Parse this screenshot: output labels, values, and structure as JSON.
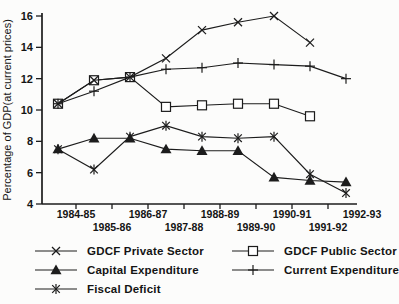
{
  "figure": {
    "background": "#fcfcfb",
    "line_color": "#1c1c1c",
    "text_color": "#141414",
    "marker_fill": "#ffffff"
  },
  "chart_data": {
    "type": "line",
    "title": "",
    "xlabel": "",
    "ylabel": "Percentage of GDP(at current prices)",
    "ylim": [
      4,
      16
    ],
    "yticks": [
      4,
      6,
      8,
      10,
      12,
      14,
      16
    ],
    "grid": false,
    "legend_position": "bottom",
    "categories": [
      "1984-85",
      "1985-86",
      "1986-87",
      "1987-88",
      "1988-89",
      "1989-90",
      "1990-91",
      "1991-92",
      "1992-93"
    ],
    "series": [
      {
        "name": "GDCF Private Sector",
        "marker": "x",
        "values": [
          10.4,
          11.9,
          12.1,
          13.3,
          15.1,
          15.6,
          16.0,
          14.3,
          null
        ]
      },
      {
        "name": "GDCF Public Sector",
        "marker": "square",
        "values": [
          10.4,
          11.9,
          12.1,
          10.2,
          10.3,
          10.4,
          10.4,
          9.6,
          null
        ]
      },
      {
        "name": "Capital Expenditure",
        "marker": "triangle",
        "values": [
          7.5,
          8.2,
          8.2,
          7.5,
          7.4,
          7.4,
          5.7,
          5.5,
          5.4
        ]
      },
      {
        "name": "Current Expenditure",
        "marker": "plus",
        "values": [
          10.4,
          11.2,
          12.1,
          12.6,
          12.7,
          13.0,
          12.9,
          12.8,
          12.0
        ]
      },
      {
        "name": "Fiscal Deficit",
        "marker": "asterisk",
        "values": [
          7.5,
          6.2,
          8.3,
          9.0,
          8.3,
          8.2,
          8.3,
          5.9,
          4.7
        ]
      }
    ]
  }
}
